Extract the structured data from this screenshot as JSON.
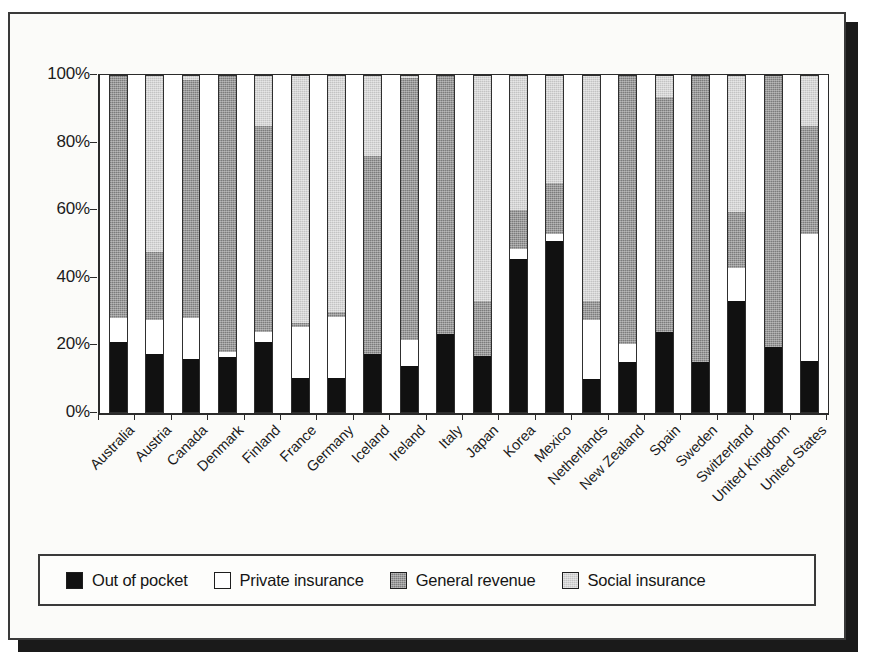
{
  "chart_data": {
    "type": "bar",
    "subtype": "stacked-percent",
    "title": "",
    "xlabel": "",
    "ylabel": "",
    "ylim": [
      0,
      100
    ],
    "ytick_labels": [
      "0%",
      "20%",
      "40%",
      "60%",
      "80%",
      "100%"
    ],
    "ytick_values": [
      0,
      20,
      40,
      60,
      80,
      100
    ],
    "grid": false,
    "legend_position": "bottom",
    "stack_order_bottom_to_top": [
      "Out of pocket",
      "Private insurance",
      "General revenue",
      "Social insurance"
    ],
    "categories": [
      "Australia",
      "Austria",
      "Canada",
      "Denmark",
      "Finland",
      "France",
      "Germany",
      "Iceland",
      "Ireland",
      "Italy",
      "Japan",
      "Korea",
      "Mexico",
      "Netherlands",
      "New Zealand",
      "Spain",
      "Sweden",
      "Switzerland",
      "United Kingdom",
      "United States"
    ],
    "series": [
      {
        "name": "Out of pocket",
        "color": "#111111",
        "values": [
          21,
          17.5,
          16,
          16.5,
          21,
          10.5,
          10.5,
          17.5,
          14,
          23.5,
          17,
          45.5,
          51,
          10,
          15,
          24,
          15,
          33,
          19.5,
          15.5
        ]
      },
      {
        "name": "Private insurance",
        "color": "#ffffff",
        "values": [
          7,
          10,
          12,
          1.5,
          3,
          15,
          18,
          0,
          7.5,
          0,
          0,
          3,
          2,
          17.5,
          5.5,
          0,
          0,
          10,
          0,
          37.5
        ]
      },
      {
        "name": "General revenue",
        "color": "#7c7c7c",
        "values": [
          72,
          20,
          70.5,
          82,
          61,
          1,
          1.5,
          58.5,
          77.5,
          76.5,
          16,
          11.5,
          15,
          5.5,
          79.5,
          69.5,
          85,
          16.5,
          80.5,
          32
        ]
      },
      {
        "name": "Social insurance",
        "color": "#c3c3c3",
        "values": [
          0,
          52.5,
          1.5,
          0,
          15,
          73.5,
          70,
          24,
          1,
          0,
          67,
          40,
          32,
          67,
          0,
          6.5,
          0,
          40.5,
          0,
          15
        ]
      }
    ]
  },
  "legend": {
    "items": [
      {
        "label": "Out of pocket",
        "swatch": "legend-swatch-black",
        "class": "sw-oop"
      },
      {
        "label": "Private insurance",
        "swatch": "legend-swatch-white",
        "class": "sw-priv"
      },
      {
        "label": "General revenue",
        "swatch": "legend-swatch-dark-gray",
        "class": "sw-gen"
      },
      {
        "label": "Social insurance",
        "swatch": "legend-swatch-light-gray",
        "class": "sw-soc"
      }
    ]
  }
}
